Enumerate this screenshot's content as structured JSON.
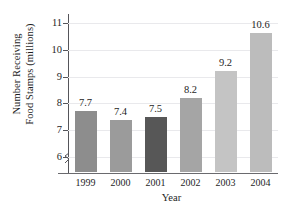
{
  "chart_data": {
    "type": "bar",
    "title": "",
    "xlabel": "Year",
    "ylabel_lines": [
      "Number Receiving",
      "Food Stamps (millions)"
    ],
    "ylabel": "Number Receiving Food Stamps (millions)",
    "categories": [
      "1999",
      "2000",
      "2001",
      "2002",
      "2003",
      "2004"
    ],
    "values": [
      7.7,
      7.4,
      7.5,
      8.2,
      9.2,
      10.6
    ],
    "value_labels": [
      "7.7",
      "7.4",
      "7.5",
      "8.2",
      "9.2",
      "10.6"
    ],
    "bar_colors": [
      "#8d8d8d",
      "#9b9b9b",
      "#575757",
      "#a5a5a5",
      "#c4c4c4",
      "#bcbcbc"
    ],
    "yticks": [
      6,
      7,
      8,
      9,
      10,
      11
    ],
    "ytick_labels": [
      "6",
      "7",
      "8",
      "9",
      "10",
      "11"
    ],
    "ylim": [
      5.45,
      11.25
    ],
    "axis_break": true,
    "grid": true,
    "grid_axis": "y",
    "legend": "none",
    "axis_color": "#55555a",
    "grid_color": "#e9e9ec"
  },
  "icons": {
    "axis_break": "axis-break-squiggle"
  }
}
